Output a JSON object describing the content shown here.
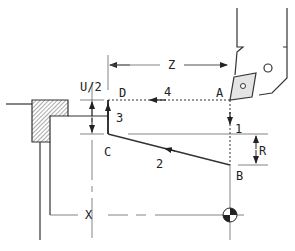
{
  "diagram": {
    "labels": {
      "z": "Z",
      "x": "X",
      "u_half": "U/2",
      "r": "R",
      "a": "A",
      "b": "B",
      "c": "C",
      "d": "D",
      "step1": "1",
      "step2": "2",
      "step3": "3",
      "step4": "4"
    },
    "colors": {
      "line": "#333333",
      "insert_fill": "#e4e4e4",
      "hatch": "#555555",
      "background": "#ffffff"
    }
  }
}
